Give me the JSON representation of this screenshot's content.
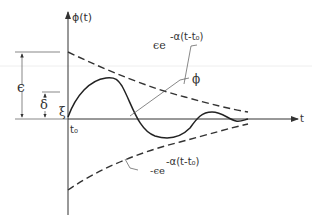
{
  "figure": {
    "y_axis_label": "ϕ(t)",
    "x_axis_label": "t",
    "origin_label": "t₀",
    "labels": {
      "epsilon": "ϵ",
      "delta": "δ",
      "xi": "ξ",
      "phi": "ϕ",
      "upper_envelope_base": "ϵe",
      "upper_envelope_exp": "-α(t-t₀)",
      "lower_envelope_base": "-ϵe",
      "lower_envelope_exp": "-α(t-t₀)"
    },
    "curves": [
      {
        "name": "upper-envelope",
        "style": "dashed",
        "formula": "ϵe^{-α(t-t₀)}"
      },
      {
        "name": "lower-envelope",
        "style": "dashed",
        "formula": "-ϵe^{-α(t-t₀)}"
      },
      {
        "name": "phi",
        "style": "solid",
        "description": "damped oscillation starting at ξ, bounded by envelopes"
      }
    ],
    "dimensions": [
      {
        "name": "epsilon",
        "from": "axis",
        "to": "envelope start"
      },
      {
        "name": "delta",
        "from": "axis",
        "to": "delta level"
      }
    ]
  }
}
